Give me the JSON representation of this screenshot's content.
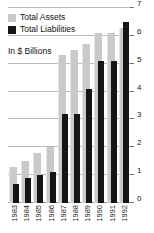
{
  "chart_data": {
    "type": "bar",
    "title": "",
    "subtitle": "In $ Billions",
    "xlabel": "",
    "ylabel": "",
    "ylim": [
      0,
      7
    ],
    "yticks": [
      0,
      1,
      2,
      3,
      4,
      5,
      6,
      7
    ],
    "ytick_labels": [
      "0",
      "1",
      "2",
      "3",
      "4",
      "5",
      "6",
      "7"
    ],
    "grid": true,
    "grid_axis": "y",
    "legend_position": "top-left",
    "categories": [
      "1983",
      "1984",
      "1985",
      "1986",
      "1987",
      "1988",
      "1989",
      "1990",
      "1991",
      "1992"
    ],
    "series": [
      {
        "name": "Total Assets",
        "color": "#c9c9c9",
        "values": [
          1.3,
          1.5,
          1.8,
          2.0,
          5.3,
          5.5,
          5.7,
          6.1,
          6.1,
          6.3
        ]
      },
      {
        "name": "Total Liabilities",
        "color": "#151515",
        "values": [
          0.7,
          0.9,
          1.0,
          1.1,
          3.2,
          3.2,
          4.1,
          5.1,
          5.1,
          6.5
        ]
      }
    ]
  },
  "legend": {
    "items": [
      {
        "label": "Total Assets",
        "color": "#c9c9c9",
        "swatch": "assets"
      },
      {
        "label": "Total Liabilities",
        "color": "#151515",
        "swatch": "liab"
      }
    ]
  },
  "units_note": "In $ Billions"
}
